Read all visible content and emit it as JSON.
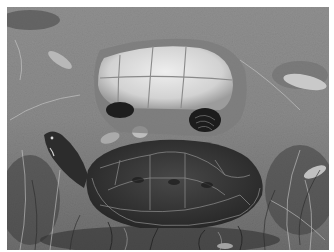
{
  "image": {
    "kind": "grayscale photograph",
    "subjects": [
      {
        "name": "overturned-turtle",
        "description": "turtle lying upside down showing pale plastron with scute seams"
      },
      {
        "name": "upright-turtle",
        "description": "dark-shelled turtle with head raised to the left, scute outlines visible"
      }
    ],
    "background": "grass, dry leaves and soil",
    "colors": {
      "border": "#ffffff",
      "ground": "#8a8a8a",
      "plastron": "#d8d8d8",
      "carapace": "#3a3a3a",
      "seams": "#9a9a9a"
    }
  }
}
